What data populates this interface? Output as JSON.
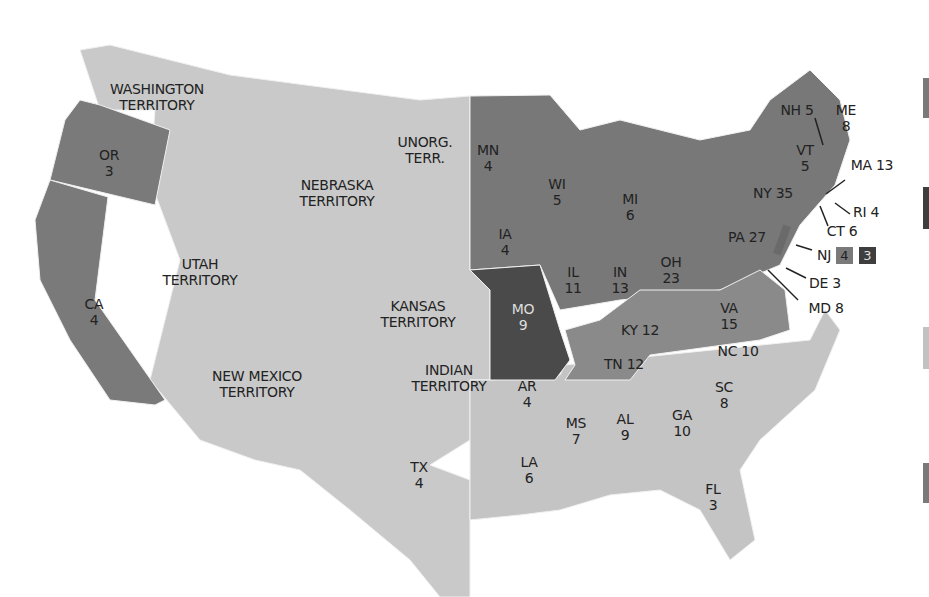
{
  "map": {
    "title": "United States Presidential Election 1856 electoral map",
    "colors": {
      "free_state": "#7a7a7a",
      "slave_state_north": "#8a8a8a",
      "territory": "#c9c9c9",
      "south": "#c4c4c4",
      "missouri": "#4a4a4a",
      "border": "#f2f2f2"
    },
    "labels": {
      "wa": {
        "name": "WASHINGTON",
        "sub": "TERRITORY"
      },
      "or": {
        "name": "OR",
        "sub": "3"
      },
      "ca": {
        "name": "CA",
        "sub": "4"
      },
      "ne": {
        "name": "NEBRASKA",
        "sub": "TERRITORY"
      },
      "unorg": {
        "name": "UNORG.",
        "sub": "TERR."
      },
      "ut": {
        "name": "UTAH",
        "sub": "TERRITORY"
      },
      "ks": {
        "name": "KANSAS",
        "sub": "TERRITORY"
      },
      "nm": {
        "name": "NEW MEXICO",
        "sub": "TERRITORY"
      },
      "ind": {
        "name": "INDIAN",
        "sub": "TERRITORY"
      },
      "tx": {
        "name": "TX",
        "sub": "4"
      },
      "mn": {
        "name": "MN",
        "sub": "4"
      },
      "wi": {
        "name": "WI",
        "sub": "5"
      },
      "mi": {
        "name": "MI",
        "sub": "6"
      },
      "ia": {
        "name": "IA",
        "sub": "4"
      },
      "il": {
        "name": "IL",
        "sub": "11"
      },
      "in": {
        "name": "IN",
        "sub": "13"
      },
      "oh": {
        "name": "OH",
        "sub": "23"
      },
      "mo": {
        "name": "MO",
        "sub": "9"
      },
      "ky": {
        "name": "KY 12"
      },
      "tn": {
        "name": "TN 12"
      },
      "va": {
        "name": "VA",
        "sub": "15"
      },
      "nc": {
        "name": "NC 10"
      },
      "sc": {
        "name": "SC",
        "sub": "8"
      },
      "ga": {
        "name": "GA",
        "sub": "10"
      },
      "al": {
        "name": "AL",
        "sub": "9"
      },
      "ms": {
        "name": "MS",
        "sub": "7"
      },
      "la": {
        "name": "LA",
        "sub": "6"
      },
      "ar": {
        "name": "AR",
        "sub": "4"
      },
      "fl": {
        "name": "FL",
        "sub": "3"
      },
      "pa": {
        "name": "PA 27"
      },
      "ny": {
        "name": "NY 35"
      },
      "vt": {
        "name": "VT",
        "sub": "5"
      },
      "nh": {
        "name": "NH 5"
      },
      "me": {
        "name": "ME",
        "sub": "8"
      },
      "ma": {
        "name": "MA 13"
      },
      "ri": {
        "name": "RI 4"
      },
      "ct": {
        "name": "CT 6"
      },
      "nj": {
        "name": "NJ",
        "split_a": "4",
        "split_b": "3"
      },
      "de": {
        "name": "DE 3"
      },
      "md": {
        "name": "MD 8"
      }
    }
  }
}
